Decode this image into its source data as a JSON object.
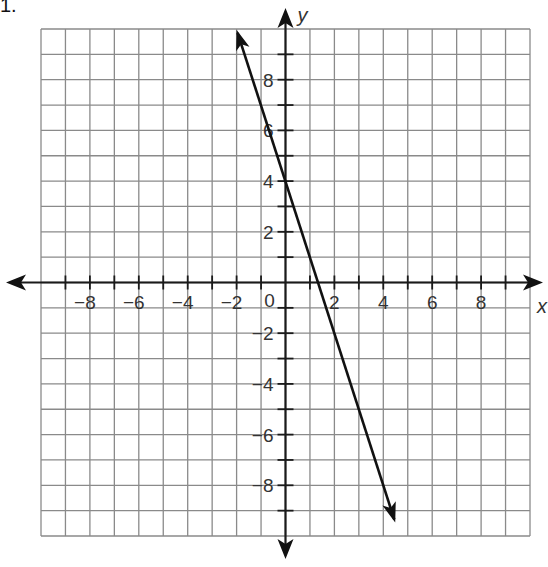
{
  "problem": {
    "number": "1."
  },
  "chart_data": {
    "type": "line",
    "title": "",
    "xlabel": "x",
    "ylabel": "y",
    "xlim": [
      -10,
      10
    ],
    "ylim": [
      -10,
      10
    ],
    "grid": true,
    "x_tick_labels": [
      "-8",
      "-6",
      "-4",
      "-2",
      "0",
      "2",
      "4",
      "6",
      "8"
    ],
    "y_tick_labels": [
      "8",
      "6",
      "4",
      "2",
      "-2",
      "-4",
      "-6",
      "-8"
    ],
    "series": [
      {
        "name": "line",
        "equation": "y = -3x + 4",
        "slope": -3,
        "y_intercept": 4,
        "x": [
          -2,
          4.67
        ],
        "y": [
          10,
          -10
        ],
        "arrows_both_ends": true
      }
    ]
  }
}
